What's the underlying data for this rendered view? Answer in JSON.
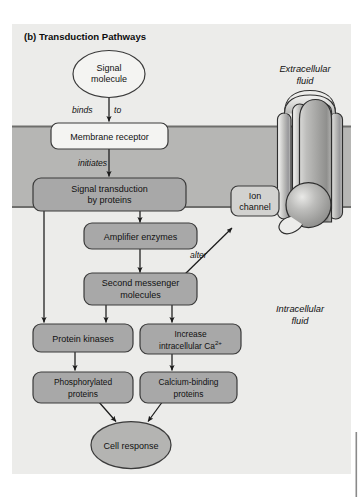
{
  "figure": {
    "panel_label": "(b) Transduction Pathways"
  },
  "regions": {
    "extracellular": "Extracellular\nfluid",
    "extracellular_line1": "Extracellular",
    "extracellular_line2": "fluid",
    "intracellular_line1": "Intracellular",
    "intracellular_line2": "fluid"
  },
  "nodes": [
    {
      "id": "signal-molecule",
      "line1": "Signal",
      "line2": "molecule",
      "shape": "ellipse",
      "fill": "#f2f2f0"
    },
    {
      "id": "membrane-receptor",
      "line1": "Membrane receptor",
      "line2": "",
      "shape": "rounded-rect",
      "fill": "#f2f2f0"
    },
    {
      "id": "signal-transduction",
      "line1": "Signal transduction",
      "line2": "by proteins",
      "shape": "rounded-rect",
      "fill": "#a8a8a8"
    },
    {
      "id": "amplifier-enzymes",
      "line1": "Amplifier enzymes",
      "line2": "",
      "shape": "rounded-rect",
      "fill": "#a8a8a8"
    },
    {
      "id": "second-messenger",
      "line1": "Second messenger",
      "line2": "molecules",
      "shape": "rounded-rect",
      "fill": "#a8a8a8"
    },
    {
      "id": "ion-channel",
      "line1": "Ion",
      "line2": "channel",
      "shape": "rounded-rect",
      "fill": "#d2d2d0"
    },
    {
      "id": "protein-kinases",
      "line1": "Protein kinases",
      "line2": "",
      "shape": "rounded-rect",
      "fill": "#a8a8a8"
    },
    {
      "id": "increase-calcium",
      "line1": "Increase",
      "line2": "intracellular Ca",
      "sup": "2+",
      "shape": "rounded-rect",
      "fill": "#a8a8a8"
    },
    {
      "id": "phosphorylated-proteins",
      "line1": "Phosphorylated",
      "line2": "proteins",
      "shape": "rounded-rect",
      "fill": "#a8a8a8"
    },
    {
      "id": "calcium-binding",
      "line1": "Calcium-binding",
      "line2": "proteins",
      "shape": "rounded-rect",
      "fill": "#a8a8a8"
    },
    {
      "id": "cell-response",
      "line1": "Cell response",
      "line2": "",
      "shape": "ellipse",
      "fill": "#b4b4b4"
    }
  ],
  "edge_labels": {
    "binds": "binds",
    "to": "to",
    "initiates": "initiates",
    "alter": "alter"
  },
  "colors": {
    "page_background": "#ffffff",
    "panel_background": "#ececea",
    "membrane_band": "#b6b6b4",
    "membrane_edge": "#6e6e6c",
    "box_fill_dark": "#a8a8a8",
    "box_fill_light": "#f2f2f0",
    "box_stroke": "#3a3a3a",
    "arrow": "#1a1a1a",
    "text": "#111111",
    "side_rule": "#8a8a8a"
  }
}
